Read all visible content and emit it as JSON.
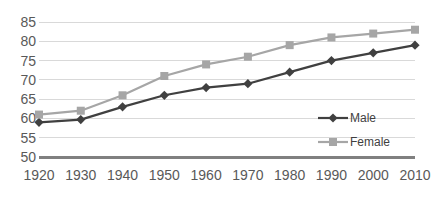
{
  "chart_data": {
    "type": "line",
    "title": "",
    "xlabel": "",
    "ylabel": "",
    "categories": [
      "1920",
      "1930",
      "1940",
      "1950",
      "1960",
      "1970",
      "1980",
      "1990",
      "2000",
      "2010"
    ],
    "x": [
      1920,
      1930,
      1940,
      1950,
      1960,
      1970,
      1980,
      1990,
      2000,
      2010
    ],
    "series": [
      {
        "name": "Male",
        "color": "#404040",
        "marker": "diamond",
        "values": [
          59,
          59.7,
          63,
          66,
          68,
          69,
          72,
          75,
          77,
          79
        ]
      },
      {
        "name": "Female",
        "color": "#a6a6a6",
        "marker": "square",
        "values": [
          61,
          62,
          66,
          71,
          74,
          76,
          79,
          81,
          82,
          83
        ]
      }
    ],
    "ylim": [
      50,
      85
    ],
    "yticks": [
      50,
      55,
      60,
      65,
      70,
      75,
      80,
      85
    ],
    "ytick_labels": [
      "50",
      "55",
      "60",
      "65",
      "70",
      "75",
      "80",
      "85"
    ],
    "xtick_labels": [
      "1920",
      "1930",
      "1940",
      "1950",
      "1960",
      "1970",
      "1980",
      "1990",
      "2000",
      "2010"
    ],
    "grid": true,
    "grid_color": "#d9d9d9",
    "axis_line_color": "#808080",
    "legend_position": "inside-right",
    "legend": [
      "Male",
      "Female"
    ],
    "tick_label_color": "#595959"
  }
}
